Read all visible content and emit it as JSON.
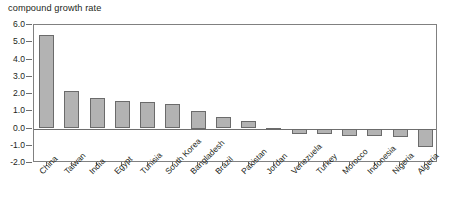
{
  "chart_data": {
    "type": "bar",
    "title": "compound growth rate",
    "xlabel": "",
    "ylabel": "",
    "ylim": [
      -2.0,
      6.0
    ],
    "ytick_step": 1.0,
    "yticks": [
      "6.0",
      "5.0",
      "4.0",
      "3.0",
      "2.0",
      "1.0",
      "0.0",
      "-1.0",
      "-2.0"
    ],
    "ytick_values": [
      6.0,
      5.0,
      4.0,
      3.0,
      2.0,
      1.0,
      0.0,
      -1.0,
      -2.0
    ],
    "grid": false,
    "legend": null,
    "legend_position": "none",
    "bar_color": "#b3b3b3",
    "bar_border_color": "#6b6b6b",
    "axis_color": "#6e6e6e",
    "text_color": "#231f20",
    "categories": [
      "China",
      "Taiwan",
      "India",
      "Egypt",
      "Tunisia",
      "South Korea",
      "Bangladesh",
      "Brazil",
      "Pakistan",
      "Jordan",
      "Venezuela",
      "Turkey",
      "Morocco",
      "Indonesia",
      "Nigeria",
      "Algeria"
    ],
    "values": [
      5.4,
      2.15,
      1.78,
      1.6,
      1.55,
      1.4,
      1.0,
      0.65,
      0.45,
      0.03,
      -0.3,
      -0.3,
      -0.42,
      -0.42,
      -0.5,
      -1.1
    ]
  }
}
